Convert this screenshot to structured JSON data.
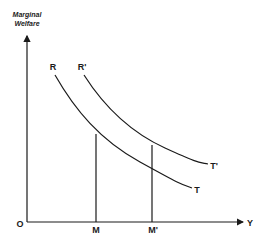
{
  "diagram": {
    "y_axis_label_line1": "Marginal",
    "y_axis_label_line2": "Welfare",
    "x_axis_label": "Y",
    "origin_label": "O",
    "curves": [
      {
        "start_label": "R",
        "end_label": "T"
      },
      {
        "start_label": "R'",
        "end_label": "T'"
      }
    ],
    "x_markers": [
      {
        "label": "M"
      },
      {
        "label": "M'"
      }
    ],
    "colors": {
      "line": "#1a1a1a",
      "background": "#ffffff"
    }
  }
}
